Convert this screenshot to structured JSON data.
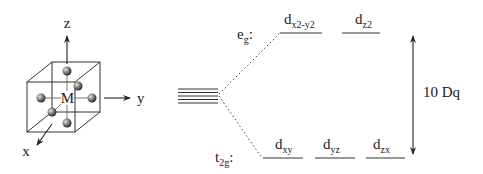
{
  "figure": {
    "type": "crystal-field-splitting-diagram",
    "geometry": "octahedral"
  },
  "cube_diagram": {
    "center_label": "M",
    "axes": {
      "z": "z",
      "y": "y",
      "x": "x"
    },
    "ligand_count": 6
  },
  "energy_levels": {
    "degenerate_count": 5,
    "eg": {
      "label_main": "e",
      "label_sub": "g",
      "label_suffix": ":",
      "orbitals": [
        {
          "main": "d",
          "sub": "x2-y2"
        },
        {
          "main": "d",
          "sub": "z2"
        }
      ]
    },
    "t2g": {
      "label_main": "t",
      "label_sub": "2g",
      "label_suffix": ":",
      "orbitals": [
        {
          "main": "d",
          "sub": "xy"
        },
        {
          "main": "d",
          "sub": "yz"
        },
        {
          "main": "d",
          "sub": "zx"
        }
      ]
    },
    "splitting_label": "10 Dq"
  },
  "colors": {
    "line": "#333333",
    "sphere_dark": "#3a3a3a",
    "sphere_light": "#dcdcdc"
  }
}
